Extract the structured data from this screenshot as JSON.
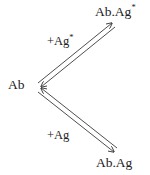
{
  "diagram": {
    "type": "reaction-scheme",
    "background_color": "#ffffff",
    "line_color": "#3a3a3a",
    "text_color": "#212121",
    "nodes": [
      {
        "id": "antibody",
        "label": "Ab",
        "superscript": "",
        "position": "left-vertex"
      },
      {
        "id": "product-excited",
        "label": "Ab.Ag",
        "superscript": "*",
        "position": "top-right"
      },
      {
        "id": "product",
        "label": "Ab.Ag",
        "superscript": "",
        "position": "bottom-right"
      }
    ],
    "edges": [
      {
        "id": "upper-branch",
        "from": "antibody",
        "to": "product-excited",
        "label": "+Ag",
        "superscript": "*",
        "arrow_style": "double-reversible"
      },
      {
        "id": "lower-branch",
        "from": "antibody",
        "to": "product",
        "label": "+Ag",
        "superscript": "",
        "arrow_style": "double-reversible"
      }
    ]
  }
}
